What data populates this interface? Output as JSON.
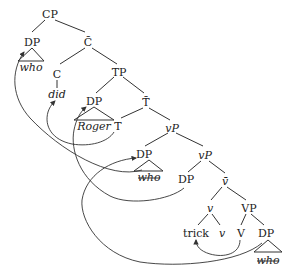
{
  "diagram": {
    "type": "syntax-tree",
    "nodes": {
      "cp": "CP",
      "dp_spec_cp": "DP",
      "who_spec_cp": "who",
      "c_bar": "C̄",
      "c": "C",
      "did": "did",
      "tp": "TP",
      "dp_spec_tp": "DP",
      "roger": "Roger",
      "t_bar": "T̄",
      "t": "T",
      "vp_top": "vP",
      "dp_outer_spec": "DP",
      "who_outer_spec": "who",
      "vp_mid": "vP",
      "dp_inner_spec": "DP",
      "v_bar": "v̄",
      "v_head": "v",
      "vp_lower": "VP",
      "trick": "trick",
      "v_small": "v",
      "v_big": "V",
      "dp_obj": "DP",
      "who_obj": "who"
    },
    "movement_arrows": [
      {
        "from": "DP (object of V, who)",
        "to": "DP (outer spec vP)"
      },
      {
        "from": "DP (outer spec vP, who)",
        "to": "DP (spec CP)"
      },
      {
        "from": "DP (inner spec vP)",
        "to": "DP (spec TP, Roger)"
      },
      {
        "from": "T",
        "to": "C (did)"
      },
      {
        "from": "V",
        "to": "v (trick)"
      }
    ],
    "struck_through": [
      "who_outer_spec",
      "who_obj"
    ]
  }
}
